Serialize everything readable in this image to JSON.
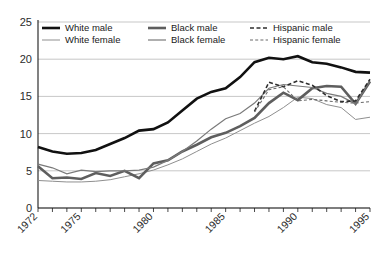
{
  "chart_data": {
    "type": "line",
    "title": "",
    "subtitle": "",
    "xlabel": "",
    "ylabel": "",
    "xlim": [
      1972,
      1995
    ],
    "ylim": [
      0,
      25
    ],
    "yticks": [
      0,
      5,
      10,
      15,
      20,
      25
    ],
    "ytick_labels": [
      "0",
      "5",
      "10",
      "15",
      "20",
      "25"
    ],
    "xticks": [
      1972,
      1973,
      1974,
      1975,
      1976,
      1977,
      1978,
      1979,
      1980,
      1981,
      1982,
      1983,
      1984,
      1985,
      1986,
      1987,
      1988,
      1989,
      1990,
      1991,
      1992,
      1993,
      1994,
      1995
    ],
    "xtick_labels_shown": [
      "1972",
      "1975",
      "1980",
      "1985",
      "1990",
      "1995"
    ],
    "xtick_labels_shown_values": [
      1972,
      1975,
      1980,
      1985,
      1990,
      1995
    ],
    "grid": "horizontal",
    "legend_position": "top-left-inside",
    "x": [
      1972,
      1973,
      1974,
      1975,
      1976,
      1977,
      1978,
      1979,
      1980,
      1981,
      1982,
      1983,
      1984,
      1985,
      1986,
      1987,
      1988,
      1989,
      1990,
      1991,
      1992,
      1993,
      1994,
      1995
    ],
    "series": [
      {
        "name": "White male",
        "color": "#111111",
        "width": 2.6,
        "dash": "none",
        "values": [
          8.2,
          7.6,
          7.3,
          7.4,
          7.8,
          8.6,
          9.4,
          10.4,
          10.6,
          11.5,
          13.1,
          14.7,
          15.6,
          16.1,
          17.6,
          19.6,
          20.2,
          20.0,
          20.4,
          19.6,
          19.4,
          18.9,
          18.3,
          18.2
        ]
      },
      {
        "name": "White female",
        "color": "#8f8f8f",
        "width": 1.0,
        "dash": "none",
        "values": [
          3.7,
          3.6,
          3.5,
          3.5,
          3.6,
          3.8,
          4.2,
          4.6,
          5.1,
          5.8,
          6.6,
          7.6,
          8.6,
          9.4,
          10.4,
          11.4,
          12.3,
          13.5,
          14.9,
          14.7,
          13.9,
          13.5,
          11.9,
          12.2
        ]
      },
      {
        "name": "Black male",
        "color": "#5e5e5e",
        "width": 2.6,
        "dash": "none",
        "values": [
          5.6,
          4.0,
          4.1,
          3.9,
          4.7,
          4.3,
          5.0,
          4.0,
          6.0,
          6.4,
          7.6,
          8.5,
          9.5,
          10.1,
          11.0,
          12.1,
          14.1,
          15.5,
          14.5,
          16.1,
          16.4,
          16.3,
          14.0,
          17.0
        ]
      },
      {
        "name": "Black female",
        "color": "#7a7a7a",
        "width": 1.2,
        "dash": "none",
        "values": [
          5.9,
          5.4,
          4.6,
          5.1,
          4.9,
          5.0,
          5.0,
          5.1,
          5.5,
          6.4,
          7.6,
          9.0,
          10.6,
          12.0,
          12.7,
          14.1,
          16.1,
          16.6,
          16.4,
          16.2,
          15.4,
          15.0,
          14.0,
          17.1
        ]
      },
      {
        "name": "Hispanic male",
        "color": "#2e2e2e",
        "width": 1.6,
        "dash": "4,2.5",
        "values": [
          null,
          null,
          null,
          null,
          null,
          null,
          null,
          null,
          null,
          null,
          null,
          null,
          null,
          null,
          null,
          13.0,
          16.9,
          16.3,
          17.1,
          16.5,
          15.1,
          14.3,
          14.4,
          17.3
        ]
      },
      {
        "name": "Hispanic female",
        "color": "#6a6a6a",
        "width": 1.1,
        "dash": "3,2.2",
        "values": [
          null,
          null,
          null,
          null,
          null,
          null,
          null,
          null,
          null,
          null,
          null,
          null,
          null,
          null,
          null,
          12.9,
          15.9,
          16.3,
          14.4,
          14.6,
          14.4,
          14.2,
          14.1,
          14.3
        ]
      }
    ]
  },
  "legend": {
    "entries": [
      {
        "label": "White male"
      },
      {
        "label": "Black male"
      },
      {
        "label": "Hispanic male"
      },
      {
        "label": "White female"
      },
      {
        "label": "Black female"
      },
      {
        "label": "Hispanic female"
      }
    ]
  },
  "axes": {
    "y_tick_labels": [
      "25",
      "20",
      "15",
      "10",
      "5",
      "0"
    ],
    "x_tick_labels": [
      "1972",
      "1975",
      "1980",
      "1985",
      "1990",
      "1995"
    ]
  },
  "colors": {
    "background": "#ffffff",
    "gridline": "#b9b9b9",
    "axis": "#1a1a1a",
    "text": "#1a1a1a"
  }
}
